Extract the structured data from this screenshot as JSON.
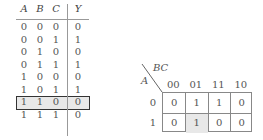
{
  "truth_table": {
    "headers": [
      "A",
      "B",
      "C",
      "Y"
    ],
    "rows": [
      [
        "0",
        "0",
        "0",
        "0"
      ],
      [
        "0",
        "0",
        "1",
        "1"
      ],
      [
        "0",
        "1",
        "0",
        "0"
      ],
      [
        "0",
        "1",
        "1",
        "1"
      ],
      [
        "1",
        "0",
        "0",
        "0"
      ],
      [
        "1",
        "0",
        "1",
        "1"
      ],
      [
        "1",
        "1",
        "0",
        "0"
      ],
      [
        "1",
        "1",
        "1",
        "0"
      ]
    ],
    "highlighted_row_index": 5
  },
  "kmap": {
    "row_var": "A",
    "col_var": "BC",
    "col_labels": [
      "00",
      "01",
      "11",
      "10"
    ],
    "row_labels": [
      "0",
      "1"
    ],
    "cells": [
      [
        "0",
        "1",
        "1",
        "0"
      ],
      [
        "0",
        "1",
        "0",
        "0"
      ]
    ],
    "highlighted_cell": [
      1,
      1
    ],
    "highlight_color": "#e8e8e8"
  }
}
